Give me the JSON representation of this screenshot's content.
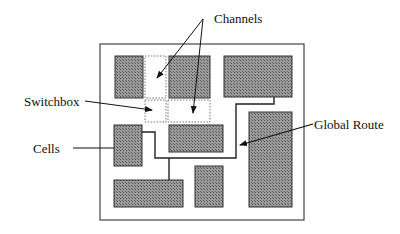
{
  "diagram": {
    "type": "chip floorplan / routing layout",
    "colors": {
      "cell_fill": "#8a8a8a",
      "cell_stroke": "#333333",
      "line": "#222222",
      "channel_stroke": "#777777",
      "background": "#ffffff"
    },
    "labels": {
      "channels": "Channels",
      "switchbox": "Switchbox",
      "cells": "Cells",
      "global_route": "Global Route"
    },
    "chip_outline": {
      "x": 100,
      "y": 44,
      "w": 204,
      "h": 176
    },
    "cells": [
      {
        "id": "cell-top-left",
        "x": 115,
        "y": 56,
        "w": 28,
        "h": 42
      },
      {
        "id": "cell-top-middle",
        "x": 169,
        "y": 56,
        "w": 41,
        "h": 42
      },
      {
        "id": "cell-top-right",
        "x": 224,
        "y": 56,
        "w": 68,
        "h": 41
      },
      {
        "id": "cell-left-middle",
        "x": 114,
        "y": 125,
        "w": 28,
        "h": 41
      },
      {
        "id": "cell-center",
        "x": 169,
        "y": 125,
        "w": 54,
        "h": 27
      },
      {
        "id": "cell-right-tall",
        "x": 249,
        "y": 112,
        "w": 43,
        "h": 95
      },
      {
        "id": "cell-bottom-left",
        "x": 114,
        "y": 180,
        "w": 69,
        "h": 27
      },
      {
        "id": "cell-bottom-middle",
        "x": 195,
        "y": 166,
        "w": 28,
        "h": 41
      }
    ],
    "channels": [
      {
        "id": "channel-vertical",
        "x": 145,
        "y": 56,
        "w": 21,
        "h": 42
      },
      {
        "id": "channel-horizontal",
        "x": 168,
        "y": 100,
        "w": 42,
        "h": 22
      }
    ],
    "switchbox": {
      "x": 145,
      "y": 100,
      "w": 21,
      "h": 22
    },
    "global_route_path": "M142,132 L155,132 L155,158 L236,158 L236,104 L274,104 L274,97",
    "global_route_branch": "M169,158 L169,180"
  }
}
